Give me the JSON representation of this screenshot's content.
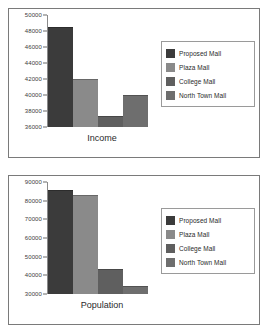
{
  "chart_data": [
    {
      "type": "bar",
      "title": "",
      "xlabel": "Income",
      "ylabel": "",
      "categories": [
        "Proposed Mall",
        "Plaza Mall",
        "College Mall",
        "North Town Mall"
      ],
      "values": [
        48500,
        42000,
        37400,
        40000
      ],
      "ylim": [
        36000,
        50000
      ],
      "yticks": [
        36000,
        38000,
        40000,
        42000,
        44000,
        46000,
        48000,
        50000
      ],
      "ytick_labels": [
        "36000",
        "38000",
        "40000",
        "42000",
        "44000",
        "46000",
        "48000",
        "50000"
      ],
      "colors": [
        "#3b3b3b",
        "#8a8a8a",
        "#5f5f5f",
        "#6e6e6e"
      ],
      "grid": false,
      "legend_position": "right"
    },
    {
      "type": "bar",
      "title": "",
      "xlabel": "Population",
      "ylabel": "",
      "categories": [
        "Proposed Mall",
        "Plaza Mall",
        "College Mall",
        "North Town Mall"
      ],
      "values": [
        85500,
        83000,
        43500,
        34500
      ],
      "ylim": [
        30000,
        90000
      ],
      "yticks": [
        30000,
        40000,
        50000,
        60000,
        70000,
        80000,
        90000
      ],
      "ytick_labels": [
        "30000",
        "40000",
        "50000",
        "60000",
        "70000",
        "80000",
        "90000"
      ],
      "colors": [
        "#3b3b3b",
        "#8a8a8a",
        "#5f5f5f",
        "#6e6e6e"
      ],
      "grid": false,
      "legend_position": "right"
    }
  ],
  "legend": {
    "items": [
      {
        "label": "Proposed Mall",
        "color": "#3b3b3b"
      },
      {
        "label": "Plaza Mall",
        "color": "#8a8a8a"
      },
      {
        "label": "College Mall",
        "color": "#5f5f5f"
      },
      {
        "label": "North Town Mall",
        "color": "#6e6e6e"
      }
    ]
  }
}
